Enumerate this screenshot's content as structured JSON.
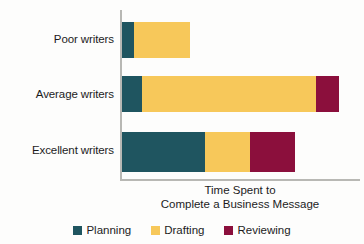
{
  "chart_data": {
    "type": "bar",
    "orientation": "horizontal",
    "stacked": true,
    "title": "",
    "xlabel": "Time Spent to Complete a Business Message",
    "xlabel_lines": [
      "Time Spent to",
      "Complete a Business Message"
    ],
    "ylabel": "",
    "categories": [
      "Poor writers",
      "Average writers",
      "Excellent writers"
    ],
    "series": [
      {
        "name": "Planning",
        "color": "#1f5560",
        "values": [
          4,
          19,
          83
        ]
      },
      {
        "name": "Drafting",
        "color": "#f7c85a",
        "values": [
          53,
          175,
          44
        ]
      },
      {
        "name": "Reviewing",
        "color": "#8b0f3c",
        "values": [
          0,
          23,
          46
        ]
      }
    ],
    "totals": [
      57,
      217,
      173
    ],
    "axis_range": [
      0,
      240
    ],
    "grid": false,
    "xticks": [],
    "legend_position": "bottom",
    "axis_color": "#b8b8b4",
    "background": "#fdfdfc"
  },
  "chart": {
    "categories": [
      {
        "label": "Poor writers"
      },
      {
        "label": "Average writers"
      },
      {
        "label": "Excellent writers"
      }
    ],
    "bars": [
      {
        "category": "Poor writers",
        "segments": [
          {
            "name": "Planning",
            "width_px": 12,
            "color": "#1f5560"
          },
          {
            "name": "Drafting",
            "width_px": 56,
            "color": "#f7c85a"
          },
          {
            "name": "Reviewing",
            "width_px": 0,
            "color": "#8b0f3c"
          }
        ]
      },
      {
        "category": "Average writers",
        "segments": [
          {
            "name": "Planning",
            "width_px": 20,
            "color": "#1f5560"
          },
          {
            "name": "Drafting",
            "width_px": 174,
            "color": "#f7c85a"
          },
          {
            "name": "Reviewing",
            "width_px": 23,
            "color": "#8b0f3c"
          }
        ]
      },
      {
        "category": "Excellent writers",
        "segments": [
          {
            "name": "Planning",
            "width_px": 83,
            "color": "#1f5560"
          },
          {
            "name": "Drafting",
            "width_px": 45,
            "color": "#f7c85a"
          },
          {
            "name": "Reviewing",
            "width_px": 45,
            "color": "#8b0f3c"
          }
        ]
      }
    ],
    "axis_title": {
      "line1": "Time Spent to",
      "line2": "Complete a Business Message"
    },
    "legend": [
      {
        "label": "Planning",
        "color": "#1f5560"
      },
      {
        "label": "Drafting",
        "color": "#f7c85a"
      },
      {
        "label": "Reviewing",
        "color": "#8b0f3c"
      }
    ]
  }
}
